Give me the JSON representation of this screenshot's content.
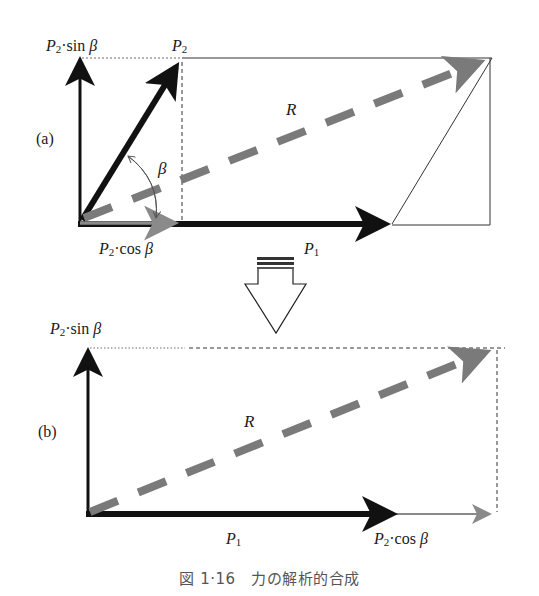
{
  "figure": {
    "caption": "図 1·16　力の解析的合成",
    "panel_a": {
      "tag": "(a)",
      "labels": {
        "p2_sin": {
          "sym": "P",
          "sub": "2",
          "rest": "·sin",
          "greek": " β"
        },
        "p2": {
          "sym": "P",
          "sub": "2"
        },
        "r": "R",
        "beta": "β",
        "p2_cos": {
          "sym": "P",
          "sub": "2",
          "rest": "·cos",
          "greek": " β"
        },
        "p1": {
          "sym": "P",
          "sub": "1"
        }
      }
    },
    "panel_b": {
      "tag": "(b)",
      "labels": {
        "p2_sin": {
          "sym": "P",
          "sub": "2",
          "rest": "·sin",
          "greek": " β"
        },
        "r": "R",
        "p1": {
          "sym": "P",
          "sub": "1"
        },
        "p2_cos": {
          "sym": "P",
          "sub": "2",
          "rest": "·cos",
          "greek": " β"
        }
      }
    },
    "colors": {
      "force": "#111111",
      "resultant": "#7a7a7a",
      "component": "#8a8a8a",
      "guide": "#222222"
    }
  }
}
